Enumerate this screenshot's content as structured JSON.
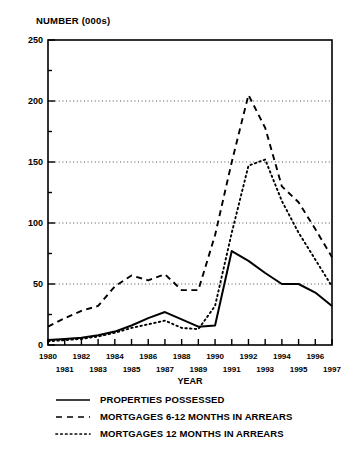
{
  "chart_data": {
    "type": "line",
    "title": "",
    "ylabel": "NUMBER (000s)",
    "xlabel": "YEAR",
    "ylim": [
      0,
      250
    ],
    "yticks": [
      0,
      50,
      100,
      150,
      200,
      250
    ],
    "yminor_step": 25,
    "grid": "horizontal-dotted",
    "legend_position": "below",
    "x": [
      1980,
      1981,
      1982,
      1983,
      1984,
      1985,
      1986,
      1987,
      1988,
      1989,
      1990,
      1991,
      1992,
      1993,
      1994,
      1995,
      1996,
      1997
    ],
    "categories": [
      "1980",
      "1981",
      "1982",
      "1983",
      "1984",
      "1985",
      "1986",
      "1987",
      "1988",
      "1989",
      "1990",
      "1991",
      "1992",
      "1993",
      "1994",
      "1995",
      "1996",
      "1997"
    ],
    "series": [
      {
        "name": "PROPERTIES POSSESSED",
        "style": "solid",
        "color": "#000000",
        "values": [
          4,
          5,
          6,
          8,
          11,
          16,
          22,
          27,
          21,
          15,
          16,
          77,
          69,
          59,
          50,
          50,
          43,
          32
        ]
      },
      {
        "name": "MORTGAGES 6-12 MONTHS IN ARREARS",
        "style": "dashed",
        "color": "#000000",
        "values": [
          15,
          22,
          28,
          32,
          48,
          57,
          53,
          58,
          45,
          45,
          90,
          150,
          205,
          178,
          130,
          117,
          95,
          72
        ]
      },
      {
        "name": "MORTGAGES 12 MONTHS IN ARREARS",
        "style": "dotted",
        "color": "#000000",
        "values": [
          3,
          4,
          5,
          7,
          10,
          14,
          17,
          20,
          14,
          13,
          32,
          92,
          147,
          152,
          118,
          92,
          70,
          48
        ]
      }
    ]
  },
  "legend": {
    "items": [
      {
        "label": "PROPERTIES POSSESSED",
        "style": "solid"
      },
      {
        "label": "MORTGAGES 6-12 MONTHS IN ARREARS",
        "style": "dashed"
      },
      {
        "label": "MORTGAGES 12 MONTHS IN ARREARS",
        "style": "dotted"
      }
    ]
  }
}
